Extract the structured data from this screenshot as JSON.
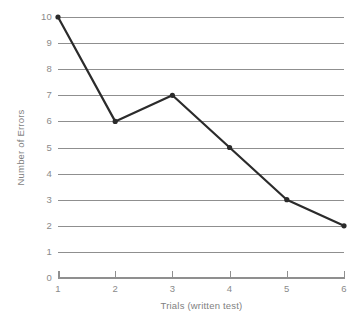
{
  "chart_data": {
    "type": "line",
    "title": "",
    "subtitle": "",
    "xlabel": "Trials (written test)",
    "ylabel": "Number of Errors",
    "x": [
      1,
      2,
      3,
      4,
      5,
      6
    ],
    "values": [
      10,
      6,
      7,
      5,
      3,
      2
    ],
    "series": [
      {
        "name": "Errors",
        "values": [
          10,
          6,
          7,
          5,
          3,
          2
        ]
      }
    ],
    "categories": [
      "1",
      "2",
      "3",
      "4",
      "5",
      "6"
    ],
    "xlim": [
      1,
      6
    ],
    "ylim": [
      0,
      10
    ],
    "x_tick_labels": [
      "1",
      "2",
      "3",
      "4",
      "5",
      "6"
    ],
    "y_tick_labels": [
      "0",
      "1",
      "2",
      "3",
      "4",
      "5",
      "6",
      "7",
      "8",
      "9",
      "10"
    ],
    "grid": true,
    "grid_axis": "y",
    "legend": false,
    "legend_position": "none",
    "annotations": [],
    "marker": "circle",
    "colors": {
      "background": "#ffffff",
      "gridline": "#8f8f8f",
      "axis": "#8f8f8f",
      "line": "#2b2b2b",
      "marker": "#2b2b2b",
      "tick_label": "#8a8a8a",
      "axis_title": "#7f7f7f"
    }
  }
}
